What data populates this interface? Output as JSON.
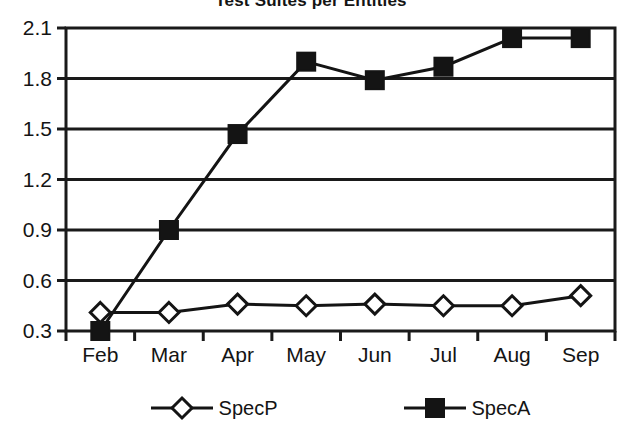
{
  "chart_data": {
    "type": "line",
    "title": "Test Suites per Entities",
    "xlabel": "",
    "ylabel": "",
    "categories": [
      "Feb",
      "Mar",
      "Apr",
      "May",
      "Jun",
      "Jul",
      "Aug",
      "Sep"
    ],
    "series": [
      {
        "name": "SpecP",
        "marker": "open-diamond",
        "color": "#141414",
        "values": [
          0.41,
          0.41,
          0.46,
          0.45,
          0.46,
          0.45,
          0.45,
          0.51
        ]
      },
      {
        "name": "SpecA",
        "marker": "filled-square",
        "color": "#141414",
        "values": [
          0.3,
          0.9,
          1.47,
          1.9,
          1.79,
          1.87,
          2.04,
          2.04
        ]
      }
    ],
    "ylim": [
      0.3,
      2.1
    ],
    "yticks": [
      0.3,
      0.6,
      0.9,
      1.2,
      1.5,
      1.8,
      2.1
    ],
    "ytick_labels": [
      "0.3",
      "0.6",
      "0.9",
      "1.2",
      "1.5",
      "1.8",
      "2.1"
    ],
    "grid": "horizontal",
    "legend_position": "bottom"
  },
  "legend": {
    "entries": [
      {
        "label": "SpecP"
      },
      {
        "label": "SpecA"
      }
    ]
  },
  "colors": {
    "ink": "#141414",
    "plot_background": "#ffffff",
    "grid": "#1a1a1a"
  }
}
